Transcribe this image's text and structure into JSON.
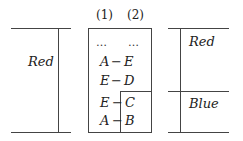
{
  "left_panel": {
    "label": "Red"
  },
  "middle_panel": {
    "headers": [
      "(1)",
      "(2)"
    ],
    "ellipsis": [
      "…",
      "…"
    ],
    "rows": [
      {
        "col1": "A",
        "sep": "−",
        "col2": "E"
      },
      {
        "col1": "E",
        "sep": "−",
        "col2": "D"
      },
      {
        "col1": "E",
        "sep": "−",
        "col2": "C"
      },
      {
        "col1": "A",
        "sep": "−",
        "col2": "B"
      }
    ]
  },
  "right_panel": {
    "top_label": "Red",
    "bottom_label": "Blue"
  },
  "colors": {
    "line": "#444444",
    "text": "#222222",
    "background": "#ffffff"
  }
}
